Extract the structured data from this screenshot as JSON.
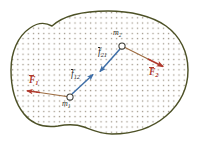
{
  "figure": {
    "canvas": {
      "width": 198,
      "height": 144,
      "background": "#ffffff"
    },
    "body": {
      "name": "rigid-body-blob",
      "outline_color": "#4d5126",
      "outline_width": 1.4,
      "fill_color": "#ffffff",
      "hatch": {
        "style": "dotted-grid",
        "dot_color": "#9a9081",
        "dot_size": 1.15,
        "spacing": 5.2
      }
    },
    "particles": [
      {
        "id": "m1",
        "label": "m",
        "subscript": "1",
        "x": 70,
        "y": 97,
        "radius": 3.1,
        "marker_color": "#3a3a34",
        "label_x": 63,
        "label_y": 102
      },
      {
        "id": "m2",
        "label": "m",
        "subscript": "2",
        "x": 122,
        "y": 46,
        "radius": 3.1,
        "marker_color": "#3a3a34",
        "label_x": 114,
        "label_y": 31
      }
    ],
    "external_forces": [
      {
        "id": "F1",
        "label": "F",
        "subscript": "1",
        "color": "#b03a2e",
        "shaft_color": "#9c6b3f",
        "from_x": 70,
        "from_y": 97,
        "to_x": 28,
        "to_y": 91,
        "label_x": 30,
        "label_y": 80
      },
      {
        "id": "F2",
        "label": "F",
        "subscript": "2",
        "color": "#b03a2e",
        "shaft_color": "#9c6b3f",
        "from_x": 122,
        "from_y": 46,
        "to_x": 162,
        "to_y": 66,
        "label_x": 150,
        "label_y": 69
      }
    ],
    "internal_forces": [
      {
        "id": "f12",
        "label": "f",
        "subscript": "12",
        "color": "#3f6fa8",
        "from_x": 70,
        "from_y": 97,
        "to_x": 92,
        "to_y": 76,
        "label_x": 72,
        "label_y": 74
      },
      {
        "id": "f21",
        "label": "f",
        "subscript": "21",
        "color": "#3f6fa8",
        "from_x": 122,
        "from_y": 46,
        "to_x": 101,
        "to_y": 70,
        "label_x": 99,
        "label_y": 52
      }
    ],
    "colors": {
      "outline": "#4d5126",
      "dot_fill": "#9a9081",
      "external_force": "#b03a2e",
      "external_shaft": "#9c6b3f",
      "internal_force": "#3f6fa8",
      "particle": "#3a3a34"
    }
  }
}
